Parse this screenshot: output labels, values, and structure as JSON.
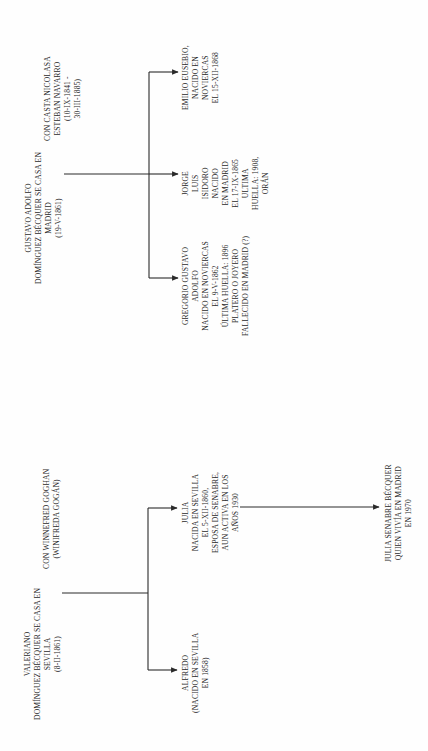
{
  "diagram": {
    "colors": {
      "ink": "#2a2a2a",
      "paper": "#fefefe"
    },
    "families": [
      {
        "id": "gustavo",
        "parent": {
          "lines": [
            "GUSTAVO ADOLFO",
            "DOMÍNGUEZ BÉCQUER SE CASA EN",
            "MADRID",
            "(19-V-1861)"
          ]
        },
        "spouse": {
          "lines": [
            "CON CASTA NICOLASA",
            "ESTEBAN NAVARRO",
            "(10-IX-1841 -",
            "30-III-1885)"
          ]
        },
        "children": [
          {
            "name": "Emilio Eusebio",
            "lines": [
              "EMILIO EUSEBIO,",
              "NACIDO EN",
              "NOVIERCAS",
              "EL 15-XII-1868"
            ]
          },
          {
            "name": "Jorge Luis Isidoro",
            "lines": [
              "JORGE",
              "LUIS",
              "ISIDORO",
              "NACIDO",
              "EN MADRID",
              "EL 17-IX-1865",
              "ULTIMA",
              "HUELLA: 1908,",
              "ORÁN"
            ]
          },
          {
            "name": "Gregorio Gustavo Adolfo",
            "lines": [
              "GREGORIO GUSTAVO",
              "ADOLFO",
              "NACIDO EN NOVIERCAS",
              "EL 9-V-1862",
              "ÚLTIMA HUELLA: 1896",
              "PLATERO O JOYERO",
              "FALLECIDO EN MADRID (?)"
            ]
          }
        ]
      },
      {
        "id": "valeriano",
        "parent": {
          "lines": [
            "VALERIANO",
            "DOMÍNGUEZ BÉCQUER SE CASA EN",
            "SEVILLA",
            "(8-II-1861)"
          ]
        },
        "spouse": {
          "lines": [
            "CON WINNEFRED GOGHAN",
            "(WINIFREDA GOGÁN)"
          ]
        },
        "children": [
          {
            "name": "Julia",
            "lines": [
              "JULIA",
              "NACIDA EN SEVILLA",
              "EL 5-XII-1860,",
              "ESPOSA DE SENABRE,",
              "AUN ACTIVA EN LOS",
              "AÑOS 1930"
            ]
          },
          {
            "name": "Alfredo",
            "lines": [
              "ALFREDO",
              "(NACIDO EN SEVILLA",
              "EN 1858)"
            ]
          }
        ],
        "grandchild": {
          "lines": [
            "JULIA SENABRE BÉCQUER",
            "QUIEN VIVÍA EN MADRID",
            "EN 1970"
          ]
        }
      }
    ]
  }
}
